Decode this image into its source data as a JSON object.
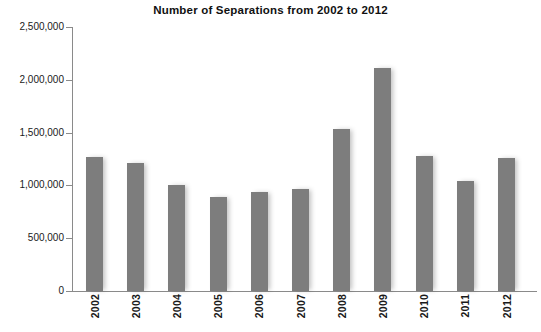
{
  "chart_data": {
    "type": "bar",
    "title": "Number of Separations from 2002 to 2012",
    "xlabel": "",
    "ylabel": "",
    "categories": [
      "2002",
      "2003",
      "2004",
      "2005",
      "2006",
      "2007",
      "2008",
      "2009",
      "2010",
      "2011",
      "2012"
    ],
    "values": [
      1270000,
      1215000,
      1000000,
      890000,
      935000,
      970000,
      1535000,
      2110000,
      1275000,
      1045000,
      1255000
    ],
    "ylim": [
      0,
      2500000
    ],
    "ytick_values": [
      0,
      500000,
      1000000,
      1500000,
      2000000,
      2500000
    ],
    "ytick_labels": [
      "0",
      "500,000",
      "1,000,000",
      "1,500,000",
      "2,000,000",
      "2,500,000"
    ],
    "grid": false,
    "legend": false,
    "bar_color": "#7d7d7d",
    "axis_color": "#8a8a8a",
    "text_color": "#1a1a1a"
  }
}
